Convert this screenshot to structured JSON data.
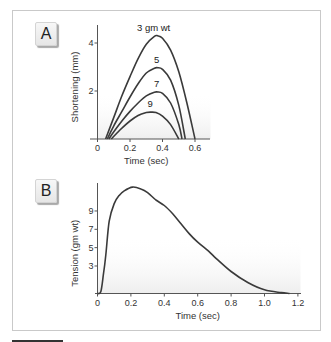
{
  "figure": {
    "panels": [
      {
        "id": "A",
        "label": "A"
      },
      {
        "id": "B",
        "label": "B"
      }
    ]
  },
  "chart_data": [
    {
      "panel": "A",
      "type": "line",
      "title": "",
      "xlabel": "Time (sec)",
      "ylabel": "Shortening (mm)",
      "xlim": [
        0,
        0.65
      ],
      "ylim": [
        0,
        4.6
      ],
      "xticks": [
        0,
        0.2,
        0.4,
        0.6
      ],
      "xtick_labels": [
        "0",
        "0.2",
        "0.4",
        "0.6"
      ],
      "yticks": [
        2,
        4
      ],
      "ytick_labels": [
        "2",
        "4"
      ],
      "grid": false,
      "legend": "inline labels above curve peaks",
      "series": [
        {
          "name": "3 gm wt",
          "label": "3 gm wt",
          "x": [
            0.05,
            0.1,
            0.15,
            0.2,
            0.25,
            0.3,
            0.35,
            0.37,
            0.4,
            0.45,
            0.5,
            0.55,
            0.6
          ],
          "y": [
            0,
            0.9,
            1.8,
            2.6,
            3.35,
            3.95,
            4.28,
            4.3,
            4.2,
            3.7,
            2.8,
            1.5,
            0
          ]
        },
        {
          "name": "5 gm wt",
          "label": "5",
          "x": [
            0.06,
            0.1,
            0.15,
            0.2,
            0.25,
            0.3,
            0.35,
            0.37,
            0.4,
            0.45,
            0.5,
            0.54
          ],
          "y": [
            0,
            0.55,
            1.15,
            1.75,
            2.3,
            2.75,
            2.95,
            2.97,
            2.9,
            2.45,
            1.4,
            0
          ]
        },
        {
          "name": "7 gm wt",
          "label": "7",
          "x": [
            0.07,
            0.1,
            0.15,
            0.2,
            0.25,
            0.3,
            0.35,
            0.37,
            0.4,
            0.45,
            0.5,
            0.52
          ],
          "y": [
            0,
            0.3,
            0.75,
            1.15,
            1.5,
            1.8,
            1.95,
            1.96,
            1.9,
            1.5,
            0.6,
            0
          ]
        },
        {
          "name": "9 gm wt",
          "label": "9",
          "x": [
            0.085,
            0.12,
            0.15,
            0.2,
            0.25,
            0.3,
            0.33,
            0.36,
            0.4,
            0.45,
            0.5
          ],
          "y": [
            0,
            0.25,
            0.45,
            0.75,
            0.98,
            1.1,
            1.12,
            1.1,
            0.95,
            0.6,
            0
          ]
        }
      ]
    },
    {
      "panel": "B",
      "type": "line",
      "title": "",
      "xlabel": "Time (sec)",
      "ylabel": "Tension (gm wt)",
      "xlim": [
        0,
        1.22
      ],
      "ylim": [
        0,
        12.2
      ],
      "xticks": [
        0,
        0.2,
        0.4,
        0.6,
        0.8,
        1.0,
        1.2
      ],
      "xtick_labels": [
        "0",
        "0.2",
        "0.4",
        "0.6",
        "0.8",
        "1.0",
        "1.2"
      ],
      "yticks": [
        3,
        5,
        7,
        9
      ],
      "ytick_labels": [
        "3",
        "5",
        "7",
        "9"
      ],
      "grid": false,
      "series": [
        {
          "name": "Tension",
          "x": [
            0.0,
            0.02,
            0.035,
            0.05,
            0.07,
            0.1,
            0.13,
            0.16,
            0.21,
            0.26,
            0.3,
            0.35,
            0.4,
            0.45,
            0.5,
            0.55,
            0.6,
            0.66,
            0.7,
            0.8,
            0.9,
            1.0,
            1.1,
            1.15
          ],
          "y": [
            0.0,
            0.2,
            2.0,
            4.2,
            7.9,
            9.8,
            10.7,
            11.2,
            11.6,
            11.4,
            11.0,
            10.2,
            9.6,
            8.7,
            7.6,
            6.5,
            5.6,
            4.7,
            4.0,
            2.4,
            1.2,
            0.4,
            0.1,
            0.0
          ]
        }
      ]
    }
  ]
}
